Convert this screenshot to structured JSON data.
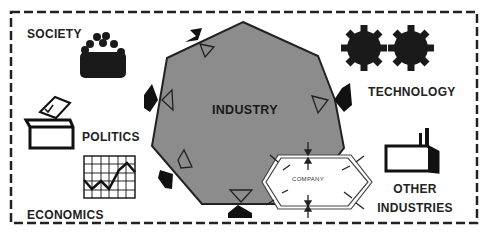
{
  "diagram": {
    "title_partial": "ENVIRONMENT",
    "center": {
      "label": "INDUSTRY",
      "color": "#8c8c8c"
    },
    "company": {
      "label": "COMPANY"
    },
    "environment_factors": [
      {
        "id": "society",
        "label": "SOCIETY",
        "icon": "crowd-icon"
      },
      {
        "id": "politics",
        "label": "POLITICS",
        "icon": "ballot-box-icon"
      },
      {
        "id": "economics",
        "label": "ECONOMICS",
        "icon": "line-chart-icon"
      },
      {
        "id": "technology",
        "label": "TECHNOLOGY",
        "icon": "gears-icon"
      },
      {
        "id": "other_industries",
        "label_line1": "OTHER",
        "label_line2": "INDUSTRIES",
        "icon": "factory-icon"
      }
    ],
    "colors": {
      "border": "#222222",
      "fill": "#8c8c8c",
      "ink": "#1a1a1a"
    }
  }
}
